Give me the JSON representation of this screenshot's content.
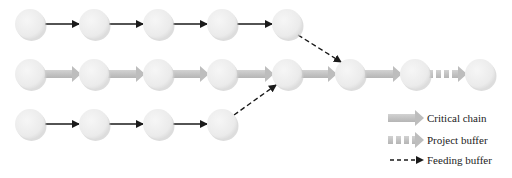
{
  "diagram": {
    "colors": {
      "node_fill": "#ececec",
      "node_shadow": "#c8c8c8",
      "critical_chain_arrow": "#c2c2c2",
      "feeding_arrow": "#1a1a1a",
      "text": "#222222"
    },
    "rows": [
      {
        "name": "feeding-chain-top",
        "y": 24,
        "nodes_x": [
          30,
          94,
          158,
          222,
          287
        ]
      },
      {
        "name": "critical-chain",
        "y": 74,
        "nodes_x": [
          30,
          94,
          158,
          222,
          287,
          350,
          415,
          480
        ]
      },
      {
        "name": "feeding-chain-bottom",
        "y": 124,
        "nodes_x": [
          30,
          94,
          158,
          222
        ]
      }
    ],
    "feeding_buffers": [
      {
        "from": "top row node 5",
        "to": "critical chain node 6"
      },
      {
        "from": "bottom row node 4",
        "to": "critical chain node 5"
      }
    ],
    "project_buffer": {
      "between": "critical chain node 7 and node 8"
    }
  },
  "legend": {
    "items": [
      {
        "label": "Critical chain",
        "symbol": "thick-gray-arrow"
      },
      {
        "label": "Project buffer",
        "symbol": "dashed-thick-gray-arrow"
      },
      {
        "label": "Feeding buffer",
        "symbol": "dashed-black-arrow"
      }
    ]
  }
}
